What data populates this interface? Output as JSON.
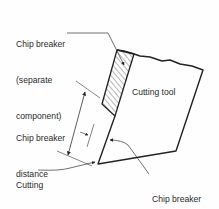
{
  "diagram": {
    "labels": {
      "chip_breaker_component": [
        "Chip breaker",
        "(separate",
        "component)"
      ],
      "cutting_tool": "Cutting tool",
      "chip_breaker_distance": [
        "Chip breaker",
        "distance"
      ],
      "cutting_edge": [
        "Cutting",
        "edge"
      ],
      "chip_breaker_height": [
        "Chip breaker",
        "height"
      ]
    },
    "colors": {
      "line": "#222222",
      "text": "#2a2a2a",
      "background": "#fefefe"
    }
  }
}
